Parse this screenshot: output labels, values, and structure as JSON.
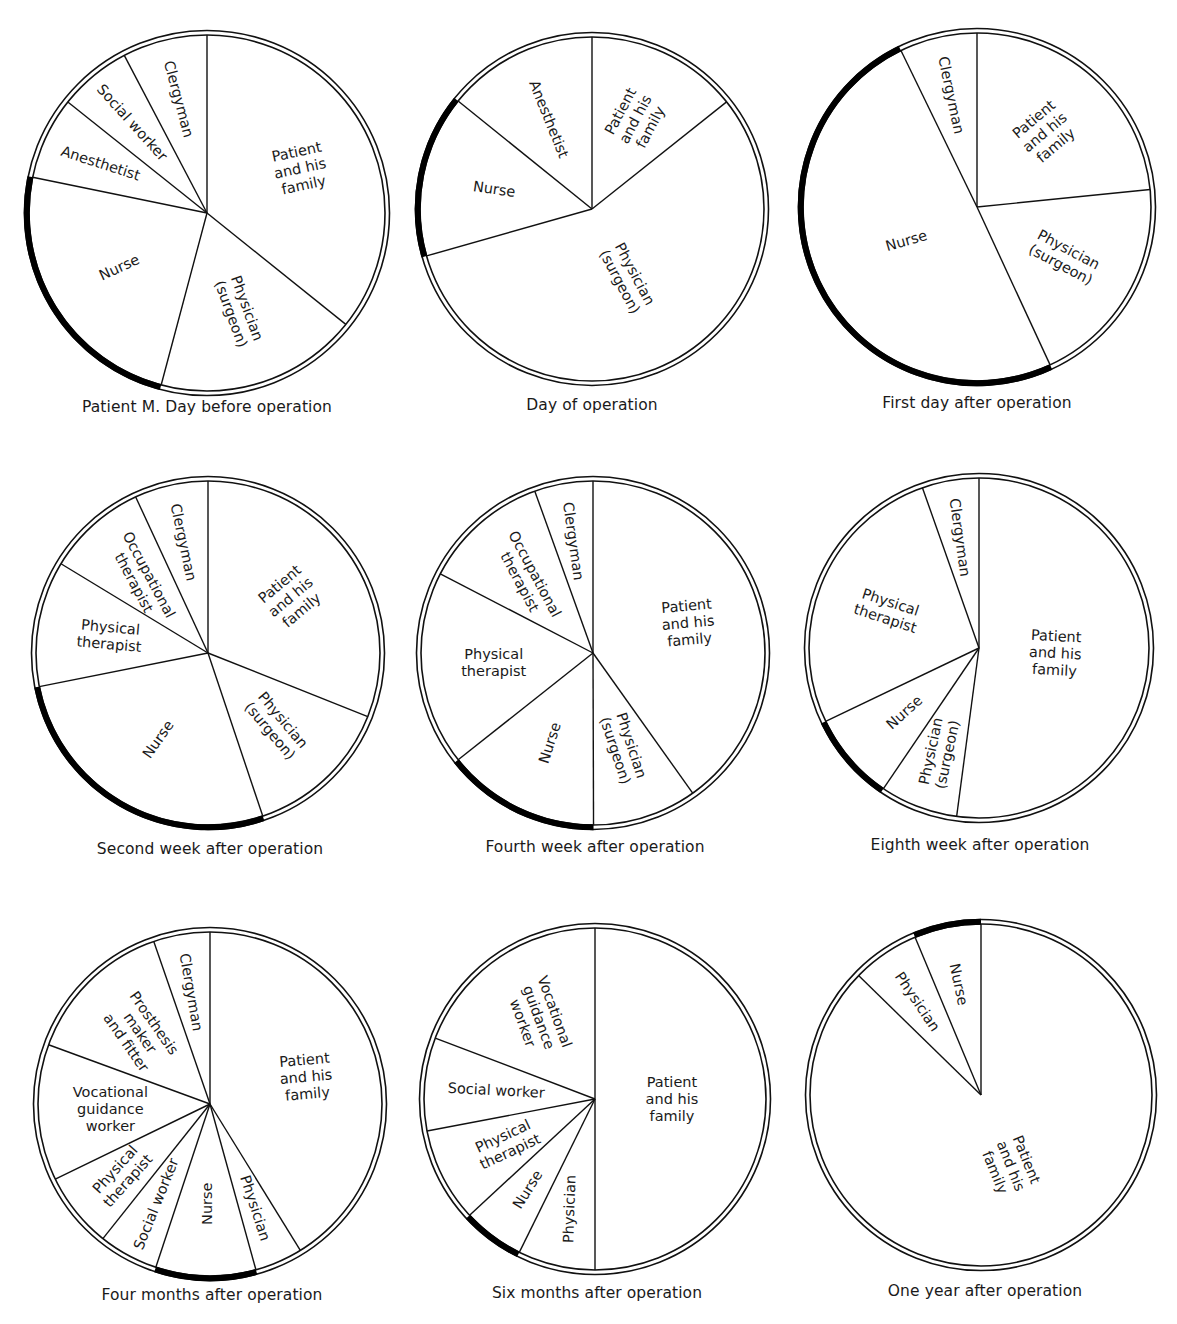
{
  "chart_data": [
    {
      "type": "pie",
      "title": "Patient M. Day before operation",
      "center": [
        207,
        213
      ],
      "radius": 178,
      "start_angle_deg": 0,
      "direction": "clockwise",
      "highlighted": "Nurse",
      "slices": [
        {
          "label": "Patient and his family",
          "lines": [
            "Patient",
            "and his",
            "family"
          ],
          "value": 35.8,
          "text_rot": -12
        },
        {
          "label": "Physician (surgeon)",
          "lines": [
            "Physician",
            "(surgeon)"
          ],
          "value": 18.4,
          "text_rot": 70
        },
        {
          "label": "Nurse",
          "lines": [
            "Nurse"
          ],
          "value": 24.1,
          "text_rot": -25
        },
        {
          "label": "Anesthetist",
          "lines": [
            "Anesthetist"
          ],
          "value": 7.5,
          "text_rot": 18
        },
        {
          "label": "Social worker",
          "lines": [
            "Social worker"
          ],
          "value": 6.6,
          "text_rot": 48
        },
        {
          "label": "Clergyman",
          "lines": [
            "Clergyman"
          ],
          "value": 7.7,
          "text_rot": 75
        }
      ]
    },
    {
      "type": "pie",
      "title": "Day of operation",
      "center": [
        592,
        209
      ],
      "radius": 172,
      "start_angle_deg": 0,
      "direction": "clockwise",
      "highlighted": "Nurse",
      "slices": [
        {
          "label": "Patient and his family",
          "lines": [
            "Patient",
            "and his",
            "family"
          ],
          "value": 14.3,
          "text_rot": -62
        },
        {
          "label": "Physician (surgeon)",
          "lines": [
            "Physician",
            "(surgeon)"
          ],
          "value": 56.3,
          "text_rot": 62
        },
        {
          "label": "Nurse",
          "lines": [
            "Nurse"
          ],
          "value": 15.2,
          "text_rot": 8
        },
        {
          "label": "Anesthetist",
          "lines": [
            "Anesthetist"
          ],
          "value": 14.2,
          "text_rot": 68
        }
      ]
    },
    {
      "type": "pie",
      "title": "First day after operation",
      "center": [
        977,
        207
      ],
      "radius": 174,
      "start_angle_deg": 0,
      "direction": "clockwise",
      "highlighted": "Nurse",
      "slices": [
        {
          "label": "Patient and his family",
          "lines": [
            "Patient",
            "and his",
            "family"
          ],
          "value": 23.4,
          "text_rot": -40
        },
        {
          "label": "Physician (surgeon)",
          "lines": [
            "Physician",
            "(surgeon)"
          ],
          "value": 19.7,
          "text_rot": 28
        },
        {
          "label": "Nurse",
          "lines": [
            "Nurse"
          ],
          "value": 49.7,
          "text_rot": -16
        },
        {
          "label": "Clergyman",
          "lines": [
            "Clergyman"
          ],
          "value": 7.2,
          "text_rot": 78
        }
      ]
    },
    {
      "type": "pie",
      "title": "Second week after operation",
      "center": [
        208,
        653
      ],
      "radius": 172,
      "start_angle_deg": 0,
      "direction": "clockwise",
      "highlighted": "Nurse",
      "slices": [
        {
          "label": "Patient and his family",
          "lines": [
            "Patient",
            "and his",
            "family"
          ],
          "value": 31.0,
          "text_rot": -40
        },
        {
          "label": "Physician (surgeon)",
          "lines": [
            "Physician",
            "(surgeon)"
          ],
          "value": 13.8,
          "text_rot": 50
        },
        {
          "label": "Nurse",
          "lines": [
            "Nurse"
          ],
          "value": 27.0,
          "text_rot": -55
        },
        {
          "label": "Physical therapist",
          "lines": [
            "Physical",
            "therapist"
          ],
          "value": 11.8,
          "text_rot": 5
        },
        {
          "label": "Occupational therapist",
          "lines": [
            "Occupational",
            "therapist"
          ],
          "value": 9.4,
          "text_rot": 62
        },
        {
          "label": "Clergyman",
          "lines": [
            "Clergyman"
          ],
          "value": 6.9,
          "text_rot": 78
        }
      ]
    },
    {
      "type": "pie",
      "title": "Fourth week after operation",
      "center": [
        593,
        653
      ],
      "radius": 172,
      "start_angle_deg": 0,
      "direction": "clockwise",
      "highlighted": "Nurse",
      "slices": [
        {
          "label": "Patient and his family",
          "lines": [
            "Patient",
            "and his",
            "family"
          ],
          "value": 40.2,
          "text_rot": -5
        },
        {
          "label": "Physician (surgeon)",
          "lines": [
            "Physician",
            "(surgeon)"
          ],
          "value": 9.8,
          "text_rot": 72
        },
        {
          "label": "Nurse",
          "lines": [
            "Nurse"
          ],
          "value": 14.4,
          "text_rot": -72
        },
        {
          "label": "Physical therapist",
          "lines": [
            "Physical",
            "therapist"
          ],
          "value": 18.3,
          "text_rot": 0
        },
        {
          "label": "Occupational therapist",
          "lines": [
            "Occupational",
            "therapist"
          ],
          "value": 11.9,
          "text_rot": 62
        },
        {
          "label": "Clergyman",
          "lines": [
            "Clergyman"
          ],
          "value": 5.5,
          "text_rot": 82
        }
      ]
    },
    {
      "type": "pie",
      "title": "Eighth week after operation",
      "center": [
        979,
        648
      ],
      "radius": 170,
      "start_angle_deg": 0,
      "direction": "clockwise",
      "highlighted": "Nurse",
      "slices": [
        {
          "label": "Patient and his family",
          "lines": [
            "Patient",
            "and his",
            "family"
          ],
          "value": 52.1,
          "text_rot": 3
        },
        {
          "label": "Physician (surgeon)",
          "lines": [
            "Physician",
            "(surgeon)"
          ],
          "value": 7.4,
          "text_rot": -78
        },
        {
          "label": "Nurse",
          "lines": [
            "Nurse"
          ],
          "value": 8.4,
          "text_rot": -42
        },
        {
          "label": "Physical therapist",
          "lines": [
            "Physical",
            "therapist"
          ],
          "value": 26.7,
          "text_rot": 18
        },
        {
          "label": "Clergyman",
          "lines": [
            "Clergyman"
          ],
          "value": 5.4,
          "text_rot": 82
        }
      ]
    },
    {
      "type": "pie",
      "title": "Four months after operation",
      "center": [
        210,
        1104
      ],
      "radius": 172,
      "start_angle_deg": 0,
      "direction": "clockwise",
      "highlighted": "Nurse",
      "slices": [
        {
          "label": "Patient and his family",
          "lines": [
            "Patient",
            "and his",
            "family"
          ],
          "value": 41.2,
          "text_rot": -5
        },
        {
          "label": "Physician",
          "lines": [
            "Physician"
          ],
          "value": 4.5,
          "text_rot": 72
        },
        {
          "label": "Nurse",
          "lines": [
            "Nurse"
          ],
          "value": 9.4,
          "text_rot": -90
        },
        {
          "label": "Social worker",
          "lines": [
            "Social worker"
          ],
          "value": 5.6,
          "text_rot": -68
        },
        {
          "label": "Physical therapist",
          "lines": [
            "Physical",
            "therapist"
          ],
          "value": 7.1,
          "text_rot": -48
        },
        {
          "label": "Vocational guidance worker",
          "lines": [
            "Vocational",
            "guidance",
            "worker"
          ],
          "value": 12.8,
          "text_rot": 0
        },
        {
          "label": "Prosthesis maker and fitter",
          "lines": [
            "Prosthesis",
            "maker",
            "and fitter"
          ],
          "value": 14.1,
          "text_rot": 55
        },
        {
          "label": "Clergyman",
          "lines": [
            "Clergyman"
          ],
          "value": 5.3,
          "text_rot": 80
        }
      ]
    },
    {
      "type": "pie",
      "title": "Six months after operation",
      "center": [
        595,
        1099
      ],
      "radius": 171,
      "start_angle_deg": 0,
      "direction": "clockwise",
      "highlighted": "Nurse",
      "slices": [
        {
          "label": "Patient and his family",
          "lines": [
            "Patient",
            "and his",
            "family"
          ],
          "value": 50.0,
          "text_rot": 0
        },
        {
          "label": "Physician",
          "lines": [
            "Physician"
          ],
          "value": 7.3,
          "text_rot": -88
        },
        {
          "label": "Nurse",
          "lines": [
            "Nurse"
          ],
          "value": 5.8,
          "text_rot": -58
        },
        {
          "label": "Physical therapist",
          "lines": [
            "Physical",
            "therapist"
          ],
          "value": 8.9,
          "text_rot": -25
        },
        {
          "label": "Social worker",
          "lines": [
            "Social worker"
          ],
          "value": 8.8,
          "text_rot": 3
        },
        {
          "label": "Vocational guidance worker",
          "lines": [
            "Vocational",
            "guidance",
            "worker"
          ],
          "value": 19.2,
          "text_rot": 70
        }
      ]
    },
    {
      "type": "pie",
      "title": "One year after operation",
      "center": [
        981,
        1095
      ],
      "radius": 171,
      "start_angle_deg": 0,
      "direction": "clockwise",
      "highlighted": "Nurse",
      "slices": [
        {
          "label": "Patient and his family",
          "lines": [
            "Patient",
            "and his",
            "family"
          ],
          "value": 87.3,
          "text_rot": 68
        },
        {
          "label": "Physician",
          "lines": [
            "Physician"
          ],
          "value": 6.4,
          "text_rot": 56
        },
        {
          "label": "Nurse",
          "lines": [
            "Nurse"
          ],
          "value": 6.3,
          "text_rot": 78
        }
      ]
    }
  ],
  "captions": {
    "c0": "Patient M. Day before operation",
    "c1": "Day of operation",
    "c2": "First day after operation",
    "c3": "Second week after operation",
    "c4": "Fourth week after operation",
    "c5": "Eighth week after operation",
    "c6": "Four months after operation",
    "c7": "Six months after operation",
    "c8": "One year after operation"
  },
  "layout": {
    "caption_positions": [
      [
        207,
        398
      ],
      [
        592,
        396
      ],
      [
        977,
        394
      ],
      [
        210,
        840
      ],
      [
        595,
        838
      ],
      [
        980,
        836
      ],
      [
        212,
        1286
      ],
      [
        597,
        1284
      ],
      [
        985,
        1282
      ]
    ]
  },
  "colors": {
    "line": "#111111",
    "background": "#ffffff",
    "highlight_arc": "#000000"
  }
}
